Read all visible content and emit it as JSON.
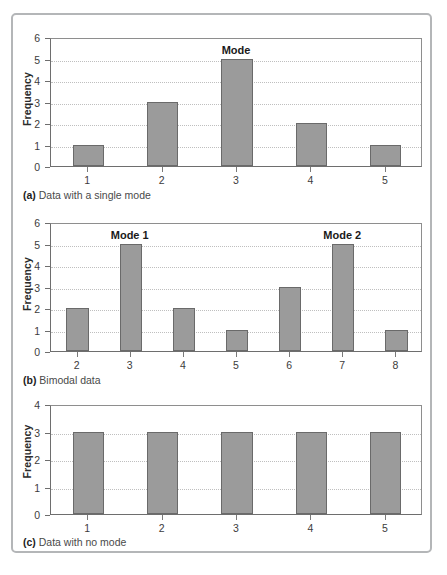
{
  "figure": {
    "panel_border_color": "#b4b6b8",
    "bar_fill_color": "#9b9b9b",
    "bar_border_color": "#6a6a6a",
    "gridline_color": "#bfbfbf"
  },
  "charts": [
    {
      "id": "a",
      "caption_marker": "(a)",
      "caption_text": " Data with a single mode",
      "chart_data": {
        "type": "bar",
        "title": "",
        "xlabel": "",
        "ylabel": "Frequency",
        "categories": [
          "1",
          "2",
          "3",
          "4",
          "5"
        ],
        "values": [
          1,
          3,
          5,
          2,
          1
        ],
        "ylim": [
          0,
          6
        ],
        "yticks": [
          0,
          1,
          2,
          3,
          4,
          5,
          6
        ],
        "grid": true,
        "legend": "none",
        "annotations": [
          {
            "text": "Mode",
            "category": "3",
            "value": 5
          }
        ]
      }
    },
    {
      "id": "b",
      "caption_marker": "(b)",
      "caption_text": " Bimodal data",
      "chart_data": {
        "type": "bar",
        "title": "",
        "xlabel": "",
        "ylabel": "Frequency",
        "categories": [
          "2",
          "3",
          "4",
          "5",
          "6",
          "7",
          "8"
        ],
        "values": [
          2,
          5,
          2,
          1,
          3,
          5,
          1
        ],
        "ylim": [
          0,
          6
        ],
        "yticks": [
          0,
          1,
          2,
          3,
          4,
          5,
          6
        ],
        "grid": true,
        "legend": "none",
        "annotations": [
          {
            "text": "Mode 1",
            "category": "3",
            "value": 5
          },
          {
            "text": "Mode 2",
            "category": "7",
            "value": 5
          }
        ]
      }
    },
    {
      "id": "c",
      "caption_marker": "(c)",
      "caption_text": " Data with no mode",
      "chart_data": {
        "type": "bar",
        "title": "",
        "xlabel": "",
        "ylabel": "Frequency",
        "categories": [
          "1",
          "2",
          "3",
          "4",
          "5"
        ],
        "values": [
          3,
          3,
          3,
          3,
          3
        ],
        "ylim": [
          0,
          4
        ],
        "yticks": [
          0,
          1,
          2,
          3,
          4
        ],
        "grid": true,
        "legend": "none",
        "annotations": []
      }
    }
  ]
}
